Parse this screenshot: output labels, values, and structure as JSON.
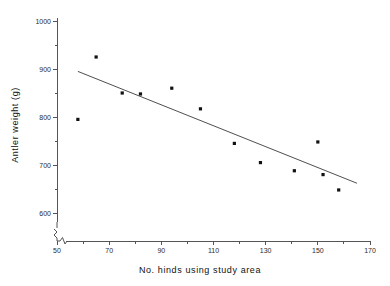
{
  "chart_data": {
    "type": "scatter",
    "title": "",
    "xlabel": "No. hinds using study area",
    "ylabel": "Antler weight (g)",
    "xlim": [
      50,
      170
    ],
    "ylim": [
      600,
      1000
    ],
    "grid": false,
    "legend": null,
    "x_ticks": [
      50,
      70,
      90,
      110,
      130,
      150,
      170
    ],
    "x_tick_labels": [
      "50",
      "70",
      "90",
      "110",
      "130",
      "150",
      "170"
    ],
    "x_minor_ticks": [
      60,
      80,
      100,
      120,
      140,
      160
    ],
    "y_ticks": [
      600,
      700,
      800,
      900,
      1000
    ],
    "y_tick_labels": [
      "600",
      "700",
      "800",
      "900",
      "1000"
    ],
    "y_minor_ticks": [
      650,
      750,
      850,
      950
    ],
    "axis_break": true,
    "points": [
      {
        "x": 58,
        "y": 795
      },
      {
        "x": 65,
        "y": 925
      },
      {
        "x": 75,
        "y": 850
      },
      {
        "x": 82,
        "y": 848
      },
      {
        "x": 94,
        "y": 860
      },
      {
        "x": 105,
        "y": 817
      },
      {
        "x": 118,
        "y": 745
      },
      {
        "x": 128,
        "y": 705
      },
      {
        "x": 141,
        "y": 688
      },
      {
        "x": 150,
        "y": 748
      },
      {
        "x": 152,
        "y": 680
      },
      {
        "x": 158,
        "y": 648
      }
    ],
    "fit_line": {
      "type": "linear-regression",
      "x_start": 58,
      "y_start": 895,
      "x_end": 165,
      "y_end": 662
    }
  },
  "xlabel_chars": "No. hinds using study area",
  "ylabel_chars": "Antler weight (g)"
}
